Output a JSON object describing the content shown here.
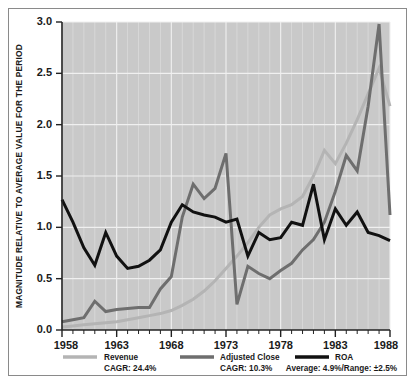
{
  "chart_data": {
    "type": "line",
    "title": "",
    "subtitle": "",
    "xlabel": "",
    "ylabel": "MAGNITUDE RELATIVE TO AVERAGE VALUE FOR THE PERIOD",
    "xlim": [
      1958,
      1988
    ],
    "ylim": [
      0.0,
      3.0
    ],
    "grid": true,
    "grid_minor_vertical": true,
    "legend_position": "bottom",
    "plot_background": "#c9c9c9",
    "gridline_color": "#f0f0f0",
    "y_ticks": [
      "0.0",
      "0.5",
      "1.0",
      "1.5",
      "2.0",
      "2.5",
      "3.0"
    ],
    "y_tick_values": [
      0.0,
      0.5,
      1.0,
      1.5,
      2.0,
      2.5,
      3.0
    ],
    "x_ticks": [
      "1958",
      "1963",
      "1968",
      "1973",
      "1978",
      "1983",
      "1988"
    ],
    "x_tick_values": [
      1958,
      1963,
      1968,
      1973,
      1978,
      1983,
      1988
    ],
    "x_minor_tick_interval": 1,
    "x": [
      1958,
      1959,
      1960,
      1961,
      1962,
      1963,
      1964,
      1965,
      1966,
      1967,
      1968,
      1969,
      1970,
      1971,
      1972,
      1973,
      1974,
      1975,
      1976,
      1977,
      1978,
      1979,
      1980,
      1981,
      1982,
      1983,
      1984,
      1985,
      1986,
      1987,
      1988
    ],
    "series": [
      {
        "name": "Revenue",
        "color": "#b4b4b4",
        "stroke_width": 3.0,
        "annotation": "CAGR: 24.4%",
        "values": [
          0.03,
          0.04,
          0.05,
          0.06,
          0.07,
          0.08,
          0.1,
          0.12,
          0.14,
          0.16,
          0.19,
          0.24,
          0.3,
          0.38,
          0.48,
          0.6,
          0.72,
          0.85,
          1.0,
          1.12,
          1.18,
          1.22,
          1.3,
          1.5,
          1.75,
          1.62,
          1.82,
          2.05,
          2.3,
          2.55,
          2.18
        ]
      },
      {
        "name": "Adjusted Close",
        "color": "#6e6e6e",
        "stroke_width": 3.0,
        "annotation": "CAGR: 10.3%",
        "values": [
          0.08,
          0.1,
          0.12,
          0.28,
          0.18,
          0.2,
          0.21,
          0.22,
          0.22,
          0.4,
          0.52,
          1.1,
          1.42,
          1.28,
          1.38,
          1.72,
          0.25,
          0.62,
          0.55,
          0.5,
          0.58,
          0.65,
          0.78,
          0.88,
          1.05,
          1.35,
          1.7,
          1.55,
          2.18,
          2.98,
          1.12
        ]
      },
      {
        "name": "ROA",
        "color": "#111111",
        "stroke_width": 3.0,
        "annotation": "Average: 4.9%/Range: ±2.5%",
        "values": [
          1.27,
          1.05,
          0.8,
          0.63,
          0.95,
          0.72,
          0.6,
          0.62,
          0.68,
          0.78,
          1.05,
          1.22,
          1.15,
          1.12,
          1.1,
          1.05,
          1.08,
          0.72,
          0.95,
          0.88,
          0.9,
          1.05,
          1.02,
          1.42,
          0.88,
          1.18,
          1.02,
          1.15,
          0.95,
          0.92,
          0.87
        ]
      }
    ]
  },
  "legend": {
    "items": [
      {
        "swatch_color": "#b4b4b4",
        "label": "Revenue",
        "sub_label": "CAGR: 24.4%"
      },
      {
        "swatch_color": "#6e6e6e",
        "label": "Adjusted Close",
        "sub_label": "CAGR: 10.3%"
      },
      {
        "swatch_color": "#111111",
        "label": "ROA",
        "sub_label": "Average: 4.9%/Range: ±2.5%"
      }
    ]
  }
}
